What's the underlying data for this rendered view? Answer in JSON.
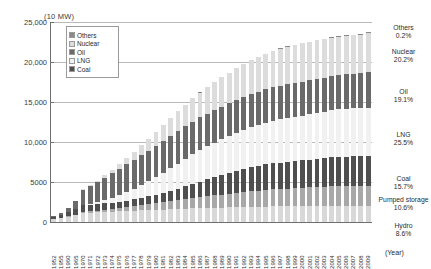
{
  "axes": {
    "y_unit_label": "(10 MW)",
    "x_axis_label": "(Year)",
    "yticks": [
      "25,000",
      "20,000",
      "15,000",
      "10,000",
      "5000",
      "0"
    ]
  },
  "legend": {
    "items": [
      {
        "label": "Others",
        "color": "#8a8a8a"
      },
      {
        "label": "Nuclear",
        "color": "#dcdcdc"
      },
      {
        "label": "Oil",
        "color": "#6a6a6a"
      },
      {
        "label": "LNG",
        "color": "#f1f1f1"
      },
      {
        "label": "Coal",
        "color": "#4f4f4f"
      }
    ]
  },
  "right_labels": [
    {
      "name": "Others",
      "pct": "0.2%",
      "top": 24
    },
    {
      "name": "Nuclear",
      "pct": "20.2%",
      "top": 48
    },
    {
      "name": "Oil",
      "pct": "19.1%",
      "top": 88
    },
    {
      "name": "LNG",
      "pct": "25.5%",
      "top": 131
    },
    {
      "name": "Coal",
      "pct": "15.7%",
      "top": 175
    },
    {
      "name": "Pumped storage",
      "pct": "10.6%",
      "top": 196
    },
    {
      "name": "Hydro",
      "pct": "8.6%",
      "top": 222
    }
  ],
  "chart_data": {
    "type": "bar",
    "title": "",
    "subtitle": "",
    "stacked": true,
    "xlabel": "(Year)",
    "ylabel": "(10 MW)",
    "ylim": [
      0,
      25000
    ],
    "ytick_values": [
      0,
      5000,
      10000,
      15000,
      20000,
      25000
    ],
    "grid": true,
    "legend_position": "inside-top-left",
    "categories": [
      "1952",
      "1955",
      "1960",
      "1965",
      "1970",
      "1971",
      "1972",
      "1973",
      "1974",
      "1975",
      "1976",
      "1977",
      "1978",
      "1979",
      "1980",
      "1981",
      "1982",
      "1983",
      "1984",
      "1985",
      "1986",
      "1987",
      "1988",
      "1989",
      "1990",
      "1991",
      "1992",
      "1993",
      "1994",
      "1995",
      "1996",
      "1997",
      "1998",
      "1999",
      "2000",
      "2001",
      "2002",
      "2003",
      "2004",
      "2005",
      "2006",
      "2007",
      "2008",
      "2009"
    ],
    "series": [
      {
        "name": "Hydro",
        "color": "#d8d8d8",
        "values": [
          420,
          500,
          680,
          880,
          1150,
          1180,
          1210,
          1240,
          1280,
          1320,
          1360,
          1400,
          1440,
          1480,
          1520,
          1560,
          1600,
          1640,
          1680,
          1720,
          1740,
          1760,
          1780,
          1800,
          1820,
          1840,
          1860,
          1880,
          1900,
          1920,
          1940,
          1950,
          1960,
          1970,
          1980,
          1985,
          1990,
          1995,
          2000,
          2005,
          2010,
          2015,
          2020,
          2025
        ]
      },
      {
        "name": "Pumped storage",
        "color": "#a8a8a8",
        "values": [
          0,
          0,
          20,
          60,
          150,
          180,
          220,
          270,
          330,
          400,
          480,
          560,
          650,
          740,
          830,
          920,
          1010,
          1100,
          1190,
          1280,
          1370,
          1460,
          1550,
          1640,
          1730,
          1820,
          1900,
          1970,
          2030,
          2090,
          2140,
          2180,
          2220,
          2260,
          2300,
          2340,
          2380,
          2420,
          2450,
          2470,
          2490,
          2500,
          2505,
          2510
        ]
      },
      {
        "name": "Coal",
        "color": "#4f4f4f",
        "values": [
          230,
          330,
          520,
          700,
          780,
          790,
          800,
          810,
          820,
          830,
          850,
          880,
          920,
          980,
          1060,
          1160,
          1290,
          1440,
          1600,
          1780,
          1950,
          2100,
          2250,
          2400,
          2550,
          2700,
          2850,
          2980,
          3090,
          3180,
          3250,
          3300,
          3340,
          3380,
          3420,
          3470,
          3520,
          3570,
          3620,
          3660,
          3690,
          3710,
          3720,
          3720
        ]
      },
      {
        "name": "LNG",
        "color": "#f1f1f1",
        "values": [
          0,
          0,
          0,
          0,
          90,
          160,
          260,
          400,
          580,
          790,
          1030,
          1290,
          1570,
          1870,
          2180,
          2500,
          2820,
          3130,
          3420,
          3690,
          3930,
          4140,
          4320,
          4480,
          4620,
          4750,
          4870,
          4990,
          5100,
          5210,
          5310,
          5400,
          5480,
          5550,
          5610,
          5680,
          5750,
          5820,
          5890,
          5950,
          6000,
          6030,
          6040,
          6040
        ]
      },
      {
        "name": "Oil",
        "color": "#6a6a6a",
        "values": [
          160,
          260,
          520,
          980,
          1850,
          2150,
          2480,
          2820,
          3100,
          3330,
          3510,
          3650,
          3760,
          3850,
          3920,
          3970,
          4010,
          4040,
          4060,
          4080,
          4090,
          4100,
          4110,
          4120,
          4130,
          4140,
          4150,
          4160,
          4170,
          4180,
          4190,
          4200,
          4210,
          4220,
          4230,
          4240,
          4250,
          4260,
          4270,
          4280,
          4290,
          4300,
          4310,
          4520
        ]
      },
      {
        "name": "Nuclear",
        "color": "#dcdcdc",
        "values": [
          0,
          0,
          0,
          0,
          70,
          130,
          200,
          290,
          420,
          590,
          790,
          1010,
          1250,
          1500,
          1750,
          2000,
          2240,
          2470,
          2690,
          2900,
          3100,
          3290,
          3470,
          3640,
          3800,
          3950,
          4090,
          4220,
          4340,
          4450,
          4550,
          4640,
          4710,
          4760,
          4790,
          4800,
          4805,
          4810,
          4815,
          4820,
          4825,
          4830,
          4835,
          4840
        ]
      },
      {
        "name": "Others",
        "color": "#8a8a8a",
        "values": [
          5,
          5,
          8,
          10,
          12,
          13,
          14,
          15,
          16,
          17,
          18,
          19,
          20,
          21,
          22,
          23,
          24,
          25,
          26,
          27,
          28,
          29,
          30,
          31,
          32,
          33,
          34,
          35,
          36,
          37,
          38,
          39,
          40,
          41,
          42,
          43,
          44,
          45,
          46,
          47,
          48,
          48,
          48,
          48
        ]
      }
    ]
  }
}
